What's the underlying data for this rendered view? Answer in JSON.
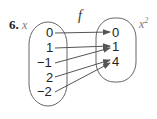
{
  "problem_number": "6.",
  "domain_label": "x",
  "function_label": "f",
  "range_label": "x",
  "range_label_exponent": "2",
  "domain_values": [
    "0",
    "1",
    "−1",
    "2",
    "−2"
  ],
  "range_values": [
    "0",
    "1",
    "4"
  ],
  "mappings": [
    {
      "from": "0",
      "to": "0"
    },
    {
      "from": "1",
      "to": "1"
    },
    {
      "from": "−1",
      "to": "1"
    },
    {
      "from": "2",
      "to": "4"
    },
    {
      "from": "−2",
      "to": "4"
    }
  ],
  "colors": {
    "oval": "#666666",
    "arrow": "#555555",
    "text": "#222222",
    "label": "#777777"
  }
}
